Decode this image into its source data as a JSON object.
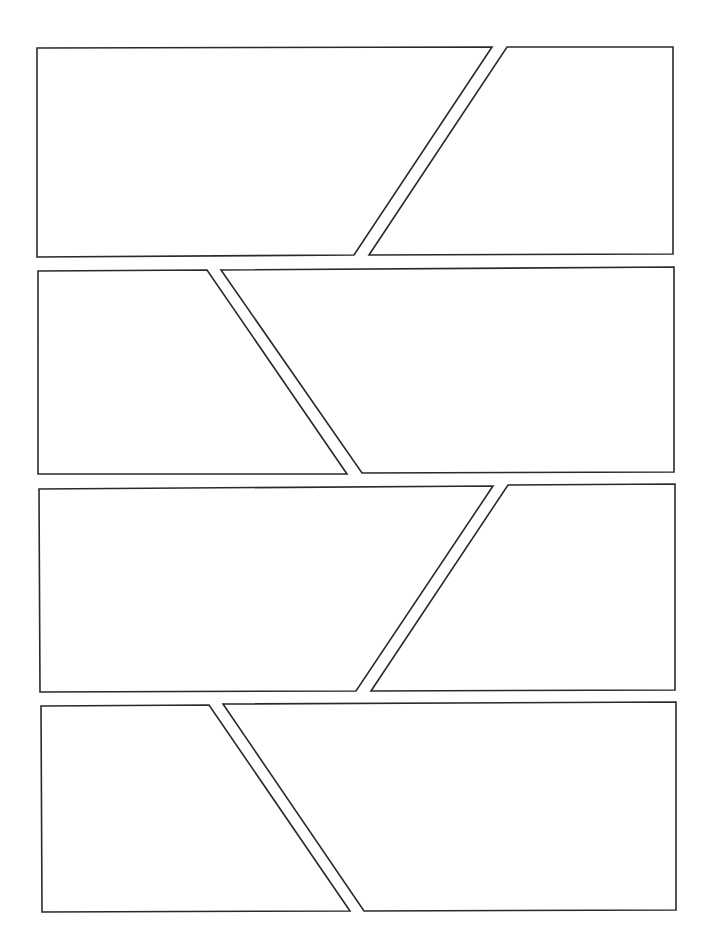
{
  "page": {
    "type": "comic-panel-layout",
    "width": 714,
    "height": 951,
    "background": "#ffffff",
    "border_color": "#2a2a2a",
    "rows": 4,
    "panels_per_row": 2
  },
  "panels": [
    {
      "id": 1,
      "row": 1,
      "position": "left",
      "points": "37,48 492,47 354,255 37,257"
    },
    {
      "id": 2,
      "row": 1,
      "position": "right",
      "points": "507,47 673,47 673,254 369,255"
    },
    {
      "id": 3,
      "row": 2,
      "position": "left",
      "points": "38,271 207,270 347,474 38,474"
    },
    {
      "id": 4,
      "row": 2,
      "position": "right",
      "points": "221,270 674,267 674,472 362,473"
    },
    {
      "id": 5,
      "row": 3,
      "position": "left",
      "points": "39,489 493,486 356,691 40,692"
    },
    {
      "id": 6,
      "row": 3,
      "position": "right",
      "points": "508,485 675,484 675,690 371,691"
    },
    {
      "id": 7,
      "row": 4,
      "position": "left",
      "points": "41,706 209,705 350,911 42,912"
    },
    {
      "id": 8,
      "row": 4,
      "position": "right",
      "points": "223,704 676,702 676,910 364,911"
    }
  ]
}
